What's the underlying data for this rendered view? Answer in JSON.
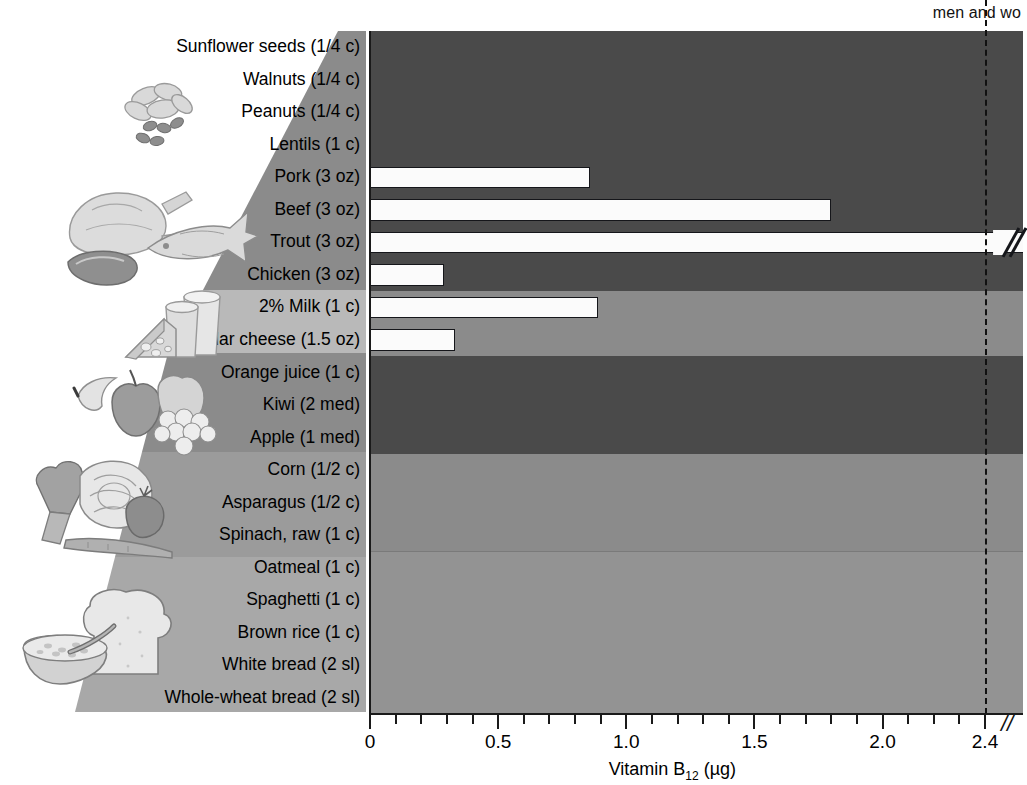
{
  "annotation": {
    "rda_note": "men and wo"
  },
  "axis": {
    "x_title_pre": "Vitamin B",
    "x_title_sub": "12",
    "x_title_post": " (µg)",
    "x_title_full": "Vitamin B12 (µg)",
    "break_symbol": "//",
    "tick_labels": [
      "0",
      "0.5",
      "1.0",
      "1.5",
      "2.0",
      "2.4"
    ],
    "tick_values": [
      0,
      0.5,
      1.0,
      1.5,
      2.0,
      2.4
    ]
  },
  "rda": {
    "value": 2.4,
    "label": "men and wo"
  },
  "colors": {
    "band_dark": "#4a4a4a",
    "band_mid": "#8b8b8b",
    "band_light": "#939393",
    "bar_fill": "#fbfbfb",
    "bar_stroke": "#15161a",
    "axis": "#1a1a1a",
    "wedge_dark": "#8b8b8b",
    "wedge_light": "#b9b9b9",
    "page_bg": "#ffffff"
  },
  "groups": [
    {
      "name": "nuts-legumes",
      "icon": "nuts-icon",
      "shade": "dark"
    },
    {
      "name": "meat-fish-poultry",
      "icon": "meat-fish-poultry-icon",
      "shade": "dark"
    },
    {
      "name": "dairy",
      "icon": "dairy-icon",
      "shade": "mid"
    },
    {
      "name": "fruits",
      "icon": "fruits-icon",
      "shade": "dark"
    },
    {
      "name": "vegetables",
      "icon": "vegetables-icon",
      "shade": "mid"
    },
    {
      "name": "grains",
      "icon": "grains-icon",
      "shade": "light"
    }
  ],
  "chart_data": {
    "type": "bar",
    "orientation": "horizontal",
    "title": "",
    "xlabel": "Vitamin B12 (µg)",
    "ylabel": "",
    "xlim": [
      0,
      2.4
    ],
    "grid": false,
    "legend": "none",
    "annotations": [
      {
        "text": "men and wo",
        "at_x": 2.4,
        "kind": "rda-dashed-line"
      }
    ],
    "categories": [
      "Sunflower seeds (1/4 c)",
      "Walnuts (1/4 c)",
      "Peanuts (1/4 c)",
      "Lentils (1 c)",
      "Pork (3 oz)",
      "Beef (3 oz)",
      "Trout (3 oz)",
      "Chicken (3 oz)",
      "2% Milk (1 c)",
      "Cheddar cheese (1.5 oz)",
      "Orange juice (1 c)",
      "Kiwi (2 med)",
      "Apple (1 med)",
      "Corn (1/2 c)",
      "Asparagus (1/2 c)",
      "Spinach, raw (1 c)",
      "Oatmeal (1 c)",
      "Spaghetti (1 c)",
      "Brown rice (1 c)",
      "White bread (2 sl)",
      "Whole-wheat bread (2 sl)"
    ],
    "values": [
      0,
      0,
      0,
      0,
      0.86,
      1.8,
      2.5,
      0.29,
      0.89,
      0.33,
      0,
      0,
      0,
      0,
      0,
      0,
      0,
      0,
      0,
      0,
      0
    ],
    "overflow": [
      false,
      false,
      false,
      false,
      false,
      false,
      true,
      false,
      false,
      false,
      false,
      false,
      false,
      false,
      false,
      false,
      false,
      false,
      false,
      false,
      false
    ]
  },
  "rows": [
    {
      "label": "Sunflower seeds (1/4 c)",
      "value": 0,
      "group": "nuts-legumes",
      "shade": "dark",
      "overflow": false
    },
    {
      "label": "Walnuts (1/4 c)",
      "value": 0,
      "group": "nuts-legumes",
      "shade": "dark",
      "overflow": false
    },
    {
      "label": "Peanuts (1/4 c)",
      "value": 0,
      "group": "nuts-legumes",
      "shade": "dark",
      "overflow": false
    },
    {
      "label": "Lentils (1 c)",
      "value": 0,
      "group": "nuts-legumes",
      "shade": "dark",
      "overflow": false
    },
    {
      "label": "Pork (3 oz)",
      "value": 0.86,
      "group": "meat-fish-poultry",
      "shade": "dark",
      "overflow": false
    },
    {
      "label": "Beef (3 oz)",
      "value": 1.8,
      "group": "meat-fish-poultry",
      "shade": "dark",
      "overflow": false
    },
    {
      "label": "Trout (3 oz)",
      "value": 2.5,
      "group": "meat-fish-poultry",
      "shade": "dark",
      "overflow": true
    },
    {
      "label": "Chicken (3 oz)",
      "value": 0.29,
      "group": "meat-fish-poultry",
      "shade": "dark",
      "overflow": false
    },
    {
      "label": "2% Milk (1 c)",
      "value": 0.89,
      "group": "dairy",
      "shade": "mid",
      "overflow": false
    },
    {
      "label": "Cheddar cheese (1.5 oz)",
      "value": 0.33,
      "group": "dairy",
      "shade": "mid",
      "overflow": false
    },
    {
      "label": "Orange juice (1 c)",
      "value": 0,
      "group": "fruits",
      "shade": "dark",
      "overflow": false
    },
    {
      "label": "Kiwi (2 med)",
      "value": 0,
      "group": "fruits",
      "shade": "dark",
      "overflow": false
    },
    {
      "label": "Apple (1 med)",
      "value": 0,
      "group": "fruits",
      "shade": "dark",
      "overflow": false
    },
    {
      "label": "Corn (1/2 c)",
      "value": 0,
      "group": "vegetables",
      "shade": "mid",
      "overflow": false
    },
    {
      "label": "Asparagus (1/2 c)",
      "value": 0,
      "group": "vegetables",
      "shade": "mid",
      "overflow": false
    },
    {
      "label": "Spinach, raw (1 c)",
      "value": 0,
      "group": "vegetables",
      "shade": "mid",
      "overflow": false
    },
    {
      "label": "Oatmeal (1 c)",
      "value": 0,
      "group": "grains",
      "shade": "light",
      "overflow": false
    },
    {
      "label": "Spaghetti (1 c)",
      "value": 0,
      "group": "grains",
      "shade": "light",
      "overflow": false
    },
    {
      "label": "Brown rice (1 c)",
      "value": 0,
      "group": "grains",
      "shade": "light",
      "overflow": false
    },
    {
      "label": "White bread (2 sl)",
      "value": 0,
      "group": "grains",
      "shade": "light",
      "overflow": false
    },
    {
      "label": "Whole-wheat bread (2 sl)",
      "value": 0,
      "group": "grains",
      "shade": "light",
      "overflow": false
    }
  ]
}
